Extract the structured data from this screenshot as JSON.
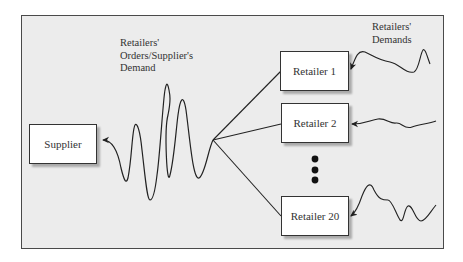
{
  "diagram": {
    "nodes": {
      "supplier": "Supplier",
      "retailer_1": "Retailer 1",
      "retailer_2": "Retailer 2",
      "retailer_20": "Retailer 20"
    },
    "labels": {
      "orders": "Retailers'\nOrders/Supplier's\nDemand",
      "demands": "Retailers'\nDemands"
    },
    "ellipsis": "•••",
    "colors": {
      "background": "#ececec",
      "frame": "#4a4a4a",
      "box": "#ffffff",
      "line": "#222222"
    }
  }
}
